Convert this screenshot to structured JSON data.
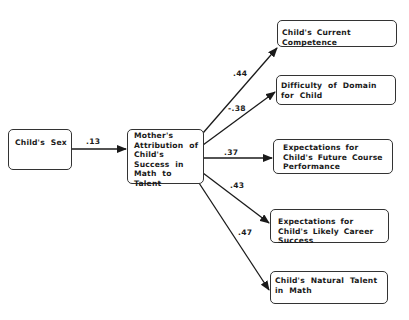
{
  "diagram": {
    "type": "path-diagram",
    "nodes": {
      "childs_sex": {
        "label": "Child's Sex"
      },
      "mothers_attribution": {
        "label": "Mother's Attribution of Child's Success in Math to Talent"
      },
      "current_competence": {
        "label": "Child's Current Competence"
      },
      "difficulty_domain": {
        "label": "Difficulty of Domain for Child"
      },
      "future_course": {
        "label": "Expectations for Child's Future Course Performance"
      },
      "career_success": {
        "label": "Expectations for Child's Likely Career Success"
      },
      "natural_talent": {
        "label": "Child's Natural Talent in Math"
      }
    },
    "edges": [
      {
        "from": "childs_sex",
        "to": "mothers_attribution",
        "coefficient": ".13"
      },
      {
        "from": "mothers_attribution",
        "to": "current_competence",
        "coefficient": ".44"
      },
      {
        "from": "mothers_attribution",
        "to": "difficulty_domain",
        "coefficient": "-.38"
      },
      {
        "from": "mothers_attribution",
        "to": "future_course",
        "coefficient": ".37"
      },
      {
        "from": "mothers_attribution",
        "to": "career_success",
        "coefficient": ".43"
      },
      {
        "from": "mothers_attribution",
        "to": "natural_talent",
        "coefficient": ".47"
      }
    ],
    "colors": {
      "line": "#1a1a1a",
      "box_border": "#333333",
      "background": "#ffffff"
    }
  }
}
